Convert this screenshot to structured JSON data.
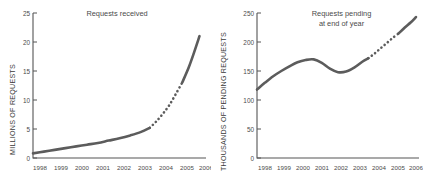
{
  "figure": {
    "background": "#ffffff",
    "line_color": "#5c5c5c",
    "axis_color": "#555555"
  },
  "chart_data": [
    {
      "type": "line",
      "id": "requests-received",
      "title": "Requests received",
      "xlabel": "",
      "ylabel": "MILLIONS OF REQUESTS",
      "xlim": [
        1998,
        2006
      ],
      "ylim": [
        0,
        25
      ],
      "yticks": [
        0,
        5,
        10,
        15,
        20,
        25
      ],
      "xticks": [
        1998,
        1999,
        2000,
        2001,
        2002,
        2003,
        2004,
        2005,
        2006
      ],
      "grid": false,
      "legend": "none",
      "series": [
        {
          "name": "Requests received (actual)",
          "style": "solid",
          "x": [
            1998.0,
            1998.5,
            1999.0,
            1999.5,
            2000.0,
            2000.5,
            2001.0,
            2001.5,
            2002.0,
            2002.5,
            2003.0,
            2003.4
          ],
          "values": [
            0.8,
            1.1,
            1.4,
            1.7,
            2.0,
            2.3,
            2.6,
            3.0,
            3.4,
            3.9,
            4.5,
            5.2
          ]
        },
        {
          "name": "Requests received (projected)",
          "style": "dotted",
          "x": [
            2003.4,
            2003.7,
            2004.0,
            2004.3,
            2004.6,
            2004.9
          ],
          "values": [
            5.2,
            6.3,
            7.6,
            9.1,
            11.0,
            13.0
          ]
        },
        {
          "name": "Requests received (final)",
          "style": "solid",
          "x": [
            2004.9,
            2005.2,
            2005.45,
            2005.7
          ],
          "values": [
            13.0,
            15.6,
            18.2,
            21.0
          ]
        }
      ]
    },
    {
      "type": "line",
      "id": "requests-pending",
      "title": "Requests pending\nat end of year",
      "xlabel": "",
      "ylabel": "THOUSANDS OF PENDING REQUESTS",
      "xlim": [
        1998,
        2006
      ],
      "ylim": [
        0,
        250
      ],
      "yticks": [
        0,
        50,
        100,
        150,
        200,
        250
      ],
      "xticks": [
        1998,
        1999,
        2000,
        2001,
        2002,
        2003,
        2004,
        2005,
        2006
      ],
      "grid": false,
      "legend": "none",
      "series": [
        {
          "name": "Requests pending (actual)",
          "style": "solid",
          "x": [
            1998.0,
            1998.4,
            1998.8,
            1999.2,
            1999.6,
            2000.0,
            2000.4,
            2000.8,
            2001.2,
            2001.6,
            2002.0,
            2002.4,
            2002.8,
            2003.2,
            2003.5
          ],
          "values": [
            118,
            130,
            141,
            150,
            158,
            165,
            169,
            170,
            164,
            154,
            148,
            149,
            156,
            166,
            172
          ]
        },
        {
          "name": "Requests pending (projected)",
          "style": "dotted",
          "x": [
            2003.5,
            2003.8,
            2004.1,
            2004.4,
            2004.7,
            2005.0
          ],
          "values": [
            172,
            180,
            189,
            198,
            207,
            215
          ]
        },
        {
          "name": "Requests pending (final)",
          "style": "solid",
          "x": [
            2005.0,
            2005.3,
            2005.6,
            2005.85
          ],
          "values": [
            215,
            225,
            234,
            243
          ]
        }
      ]
    }
  ]
}
